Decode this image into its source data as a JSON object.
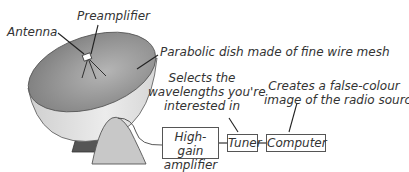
{
  "diagram": {
    "type": "radio telescope signal chain",
    "labels": {
      "antenna": "Antenna",
      "preamplifier": "Preamplifier",
      "dish": "Parabolic dish made of fine wire mesh",
      "tuner_note_1": "Selects the",
      "tuner_note_2": "wavelengths you're",
      "tuner_note_3": "interested in",
      "computer_note_1": "Creates a false-colour",
      "computer_note_2": "image of the radio source"
    },
    "blocks": [
      {
        "id": "amplifier",
        "line1": "High-gain",
        "line2": "amplifier"
      },
      {
        "id": "tuner",
        "line1": "Tuner"
      },
      {
        "id": "computer",
        "line1": "Computer"
      }
    ],
    "colors": {
      "dish_inner": "#8a8a8a",
      "dish_outer": "#dcdcdc",
      "mount_front": "#c8c8c8",
      "mount_back": "#555555",
      "lines": "#333333"
    }
  }
}
